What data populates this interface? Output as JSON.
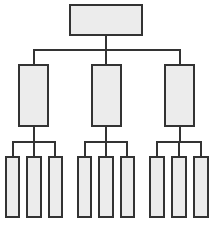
{
  "diagram": {
    "type": "org-chart",
    "title": "",
    "colors": {
      "stroke": "#333333",
      "fill": "#ececec",
      "background": "#ffffff"
    },
    "root": {
      "id": "root",
      "label": "",
      "box": [
        69,
        4,
        74,
        32
      ]
    },
    "level1": [
      {
        "id": "n1",
        "label": "",
        "box": [
          18,
          64,
          31,
          63
        ]
      },
      {
        "id": "n2",
        "label": "",
        "box": [
          91,
          64,
          31,
          63
        ]
      },
      {
        "id": "n3",
        "label": "",
        "box": [
          164,
          64,
          31,
          63
        ]
      }
    ],
    "level2": [
      {
        "id": "n1a",
        "parent": "n1",
        "label": "",
        "box": [
          5,
          156,
          15,
          62
        ]
      },
      {
        "id": "n1b",
        "parent": "n1",
        "label": "",
        "box": [
          26,
          156,
          16,
          62
        ]
      },
      {
        "id": "n1c",
        "parent": "n1",
        "label": "",
        "box": [
          48,
          156,
          15,
          62
        ]
      },
      {
        "id": "n2a",
        "parent": "n2",
        "label": "",
        "box": [
          77,
          156,
          15,
          62
        ]
      },
      {
        "id": "n2b",
        "parent": "n2",
        "label": "",
        "box": [
          98,
          156,
          16,
          62
        ]
      },
      {
        "id": "n2c",
        "parent": "n2",
        "label": "",
        "box": [
          120,
          156,
          15,
          62
        ]
      },
      {
        "id": "n3a",
        "parent": "n3",
        "label": "",
        "box": [
          149,
          156,
          16,
          62
        ]
      },
      {
        "id": "n3b",
        "parent": "n3",
        "label": "",
        "box": [
          171,
          156,
          16,
          62
        ]
      },
      {
        "id": "n3c",
        "parent": "n3",
        "label": "",
        "box": [
          193,
          156,
          16,
          62
        ]
      }
    ],
    "connectors": [
      {
        "id": "root-stem",
        "rect": [
          105,
          36,
          2,
          15
        ]
      },
      {
        "id": "l1-bus",
        "rect": [
          33,
          49,
          148,
          2
        ]
      },
      {
        "id": "l1-drop-1",
        "rect": [
          33,
          49,
          2,
          15
        ]
      },
      {
        "id": "l1-drop-2",
        "rect": [
          105,
          49,
          2,
          15
        ]
      },
      {
        "id": "l1-drop-3",
        "rect": [
          179,
          49,
          2,
          15
        ]
      },
      {
        "id": "n1-stem",
        "rect": [
          33,
          127,
          2,
          15
        ]
      },
      {
        "id": "n1-bus",
        "rect": [
          12,
          141,
          44,
          2
        ]
      },
      {
        "id": "n1-drop-a",
        "rect": [
          12,
          141,
          2,
          15
        ]
      },
      {
        "id": "n1-drop-b",
        "rect": [
          33,
          141,
          2,
          15
        ]
      },
      {
        "id": "n1-drop-c",
        "rect": [
          54,
          141,
          2,
          15
        ]
      },
      {
        "id": "n2-stem",
        "rect": [
          105,
          127,
          2,
          15
        ]
      },
      {
        "id": "n2-bus",
        "rect": [
          84,
          141,
          44,
          2
        ]
      },
      {
        "id": "n2-drop-a",
        "rect": [
          84,
          141,
          2,
          15
        ]
      },
      {
        "id": "n2-drop-b",
        "rect": [
          105,
          141,
          2,
          15
        ]
      },
      {
        "id": "n2-drop-c",
        "rect": [
          126,
          141,
          2,
          15
        ]
      },
      {
        "id": "n3-stem",
        "rect": [
          179,
          127,
          2,
          15
        ]
      },
      {
        "id": "n3-bus",
        "rect": [
          156,
          141,
          46,
          2
        ]
      },
      {
        "id": "n3-drop-a",
        "rect": [
          156,
          141,
          2,
          15
        ]
      },
      {
        "id": "n3-drop-b",
        "rect": [
          178,
          141,
          2,
          15
        ]
      },
      {
        "id": "n3-drop-c",
        "rect": [
          200,
          141,
          2,
          15
        ]
      }
    ]
  }
}
